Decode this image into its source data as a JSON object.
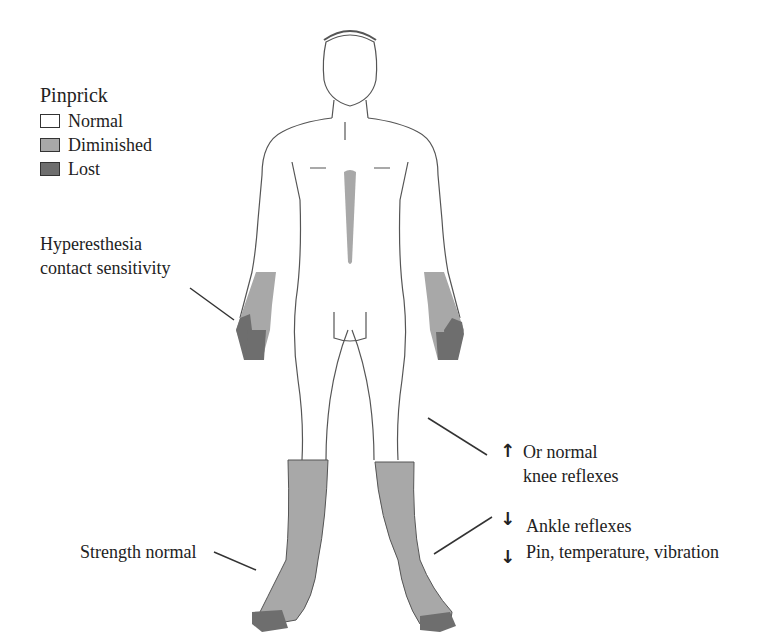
{
  "legend": {
    "title": "Pinprick",
    "items": [
      {
        "label": "Normal",
        "color": "#ffffff"
      },
      {
        "label": "Diminished",
        "color": "#a8a8a8"
      },
      {
        "label": "Lost",
        "color": "#6e6e6e"
      }
    ]
  },
  "annotations": {
    "hyperesthesia": {
      "line1": "Hyperesthesia",
      "line2": "contact sensitivity"
    },
    "knee": {
      "arrow": "↑",
      "line1": "Or normal",
      "line2": "knee reflexes"
    },
    "ankle": {
      "arrow": "↓",
      "text": "Ankle reflexes"
    },
    "sensation": {
      "arrow": "↓",
      "text": "Pin, temperature, vibration"
    },
    "strength": {
      "text": "Strength normal"
    }
  },
  "colors": {
    "diminished": "#a8a8a8",
    "lost": "#6e6e6e",
    "outline": "#555555"
  }
}
